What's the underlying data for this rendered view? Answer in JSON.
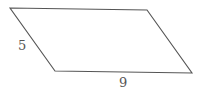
{
  "diagram": {
    "shape": "parallelogram",
    "vertices": [
      [
        10,
        8
      ],
      [
        147,
        10
      ],
      [
        192,
        73
      ],
      [
        55,
        71
      ]
    ],
    "stroke_color": "#555555",
    "labels": {
      "side": "5",
      "base": "9"
    }
  }
}
